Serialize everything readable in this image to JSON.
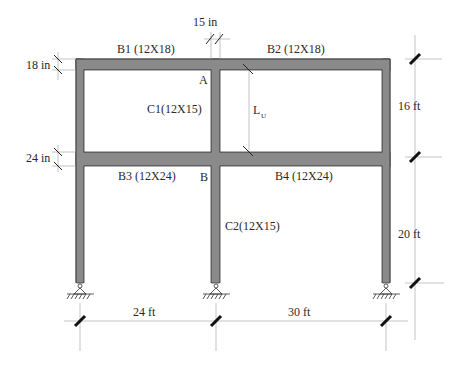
{
  "diagram": {
    "type": "structural-frame",
    "beams": [
      {
        "id": "B1",
        "label": "B1 (12X18)",
        "story": "top",
        "bay": "left"
      },
      {
        "id": "B2",
        "label": "B2 (12X18)",
        "story": "top",
        "bay": "right"
      },
      {
        "id": "B3",
        "label": "B3 (12X24)",
        "story": "first",
        "bay": "left"
      },
      {
        "id": "B4",
        "label": "B4 (12X24)",
        "story": "first",
        "bay": "right"
      }
    ],
    "columns": [
      {
        "id": "C1",
        "label": "C1(12X15)",
        "story": "top"
      },
      {
        "id": "C2",
        "label": "C2(12X15)",
        "story": "first"
      }
    ],
    "joints": {
      "a": "A",
      "b": "B"
    },
    "unbraced_length_label": "L",
    "unbraced_length_subscript": "U",
    "dimensions": {
      "top_beam_depth": "18 in",
      "first_beam_depth": "24 in",
      "column_width": "15 in",
      "upper_story_height": "16 ft",
      "lower_story_height": "20 ft",
      "left_bay_width": "24 ft",
      "right_bay_width": "30 ft"
    },
    "supports": [
      "pin",
      "pin",
      "pin"
    ],
    "colors": {
      "member_fill": "#8a8a8a",
      "member_outline": "#3a3a3a",
      "dimension_line": "#9a9a9a",
      "text": "#2a2a2a"
    }
  }
}
